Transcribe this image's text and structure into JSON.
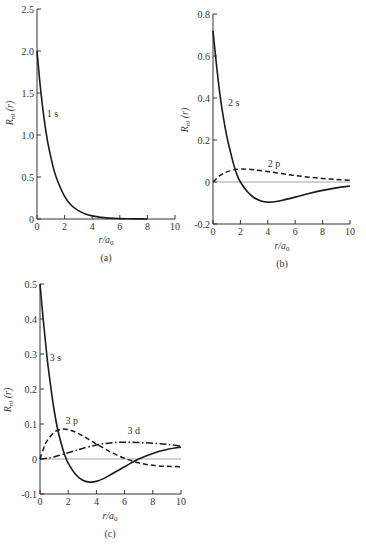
{
  "chart_data": [
    {
      "type": "line",
      "panel": "(a)",
      "xlabel": "r/a0",
      "ylabel": "R_nl (r)",
      "xlim": [
        0,
        10
      ],
      "ylim": [
        0,
        2.5
      ],
      "xticks": [
        0,
        2,
        4,
        6,
        8,
        10
      ],
      "yticks": [
        0,
        0.5,
        1.0,
        1.5,
        2.0,
        2.5
      ],
      "ytick_labels": [
        "0",
        "0.5",
        "1.0",
        "1.5",
        "2.0",
        "2.5"
      ],
      "zero_line": false,
      "series": [
        {
          "name": "1 s",
          "style": "solid",
          "x": [
            0,
            0.25,
            0.5,
            0.75,
            1,
            1.25,
            1.5,
            2,
            2.5,
            3,
            3.5,
            4,
            5,
            6,
            7,
            8
          ],
          "values": [
            2.0,
            1.56,
            1.21,
            0.94,
            0.74,
            0.57,
            0.45,
            0.27,
            0.16,
            0.1,
            0.06,
            0.037,
            0.013,
            0.005,
            0.002,
            0.0007
          ]
        }
      ],
      "labels": [
        {
          "text": "1 s",
          "x": 0.7,
          "y": 1.22
        }
      ]
    },
    {
      "type": "line",
      "panel": "(b)",
      "xlabel": "r/a0",
      "ylabel": "R_nl (r)",
      "xlim": [
        0,
        10
      ],
      "ylim": [
        -0.2,
        0.8
      ],
      "xticks": [
        0,
        2,
        4,
        6,
        8,
        10
      ],
      "yticks": [
        -0.2,
        0,
        0.2,
        0.4,
        0.6,
        0.8
      ],
      "ytick_labels": [
        "-0.2",
        "0",
        "0.2",
        "0.4",
        "0.6",
        "0.8"
      ],
      "zero_line": true,
      "series": [
        {
          "name": "2 s",
          "style": "solid",
          "x": [
            0,
            0.25,
            0.5,
            0.75,
            1,
            1.25,
            1.5,
            1.75,
            2,
            2.5,
            3,
            3.5,
            4,
            4.5,
            5,
            6,
            7,
            8,
            9,
            10
          ],
          "values": [
            0.72,
            0.56,
            0.42,
            0.31,
            0.22,
            0.15,
            0.085,
            0.035,
            0.0,
            -0.045,
            -0.075,
            -0.09,
            -0.096,
            -0.094,
            -0.088,
            -0.072,
            -0.055,
            -0.04,
            -0.028,
            -0.019
          ]
        },
        {
          "name": "2 p",
          "style": "dashed",
          "x": [
            0,
            0.5,
            1,
            1.5,
            2,
            2.5,
            3,
            4,
            5,
            6,
            7,
            8,
            9,
            10
          ],
          "values": [
            0.0,
            0.03,
            0.048,
            0.058,
            0.062,
            0.061,
            0.058,
            0.05,
            0.04,
            0.031,
            0.023,
            0.017,
            0.012,
            0.008
          ]
        }
      ],
      "labels": [
        {
          "text": "2 s",
          "x": 1.1,
          "y": 0.36
        },
        {
          "text": "2 p",
          "x": 4.0,
          "y": 0.07
        }
      ]
    },
    {
      "type": "line",
      "panel": "(c)",
      "xlabel": "r/a0",
      "ylabel": "R_nl (r)",
      "xlim": [
        0,
        10
      ],
      "ylim": [
        -0.1,
        0.5
      ],
      "xticks": [
        0,
        2,
        4,
        6,
        8,
        10
      ],
      "yticks": [
        -0.1,
        0,
        0.1,
        0.2,
        0.3,
        0.4,
        0.5
      ],
      "ytick_labels": [
        "-0.1",
        "0",
        "0.1",
        "0.2",
        "0.3",
        "0.4",
        "0.5"
      ],
      "zero_line": true,
      "series": [
        {
          "name": "3 s",
          "style": "solid",
          "x": [
            0,
            0.25,
            0.5,
            0.75,
            1,
            1.25,
            1.5,
            1.75,
            2,
            2.5,
            3,
            3.5,
            4,
            4.5,
            5,
            6,
            7,
            8,
            9,
            10
          ],
          "values": [
            0.5,
            0.39,
            0.29,
            0.21,
            0.14,
            0.085,
            0.045,
            0.012,
            -0.012,
            -0.043,
            -0.06,
            -0.066,
            -0.064,
            -0.056,
            -0.045,
            -0.022,
            0.0,
            0.016,
            0.027,
            0.034
          ]
        },
        {
          "name": "3 p",
          "style": "dashed",
          "x": [
            0,
            0.25,
            0.5,
            1,
            1.5,
            2,
            2.5,
            3,
            3.5,
            4,
            5,
            6,
            7,
            8,
            9,
            10
          ],
          "values": [
            0.0,
            0.03,
            0.052,
            0.076,
            0.085,
            0.084,
            0.077,
            0.067,
            0.055,
            0.043,
            0.02,
            0.002,
            -0.011,
            -0.018,
            -0.021,
            -0.022
          ]
        },
        {
          "name": "3 d",
          "style": "dashdot",
          "x": [
            0,
            0.5,
            1,
            1.5,
            2,
            2.5,
            3,
            4,
            5,
            6,
            7,
            8,
            9,
            10
          ],
          "values": [
            0.0,
            0.002,
            0.006,
            0.012,
            0.018,
            0.024,
            0.03,
            0.04,
            0.046,
            0.048,
            0.047,
            0.045,
            0.042,
            0.037
          ]
        }
      ],
      "labels": [
        {
          "text": "3 s",
          "x": 0.7,
          "y": 0.28
        },
        {
          "text": "3 p",
          "x": 1.8,
          "y": 0.1
        },
        {
          "text": "3 d",
          "x": 6.2,
          "y": 0.072
        }
      ]
    }
  ],
  "panels": {
    "a": {
      "caption": "(a)",
      "xlabel_main": "r/a",
      "xlabel_sub": "0",
      "ylabel_main": "R",
      "ylabel_sub": "nl",
      "ylabel_rest": " (r)"
    },
    "b": {
      "caption": "(b)",
      "xlabel_main": "r/a",
      "xlabel_sub": "0",
      "ylabel_main": "R",
      "ylabel_sub": "nl",
      "ylabel_rest": " (r)"
    },
    "c": {
      "caption": "(c)",
      "xlabel_main": "r/a",
      "xlabel_sub": "0",
      "ylabel_main": "R",
      "ylabel_sub": "nl",
      "ylabel_rest": " (r)"
    }
  },
  "colors": {
    "curve": "#1a1a1a",
    "axis": "#333333",
    "zero_line": "#666666"
  }
}
